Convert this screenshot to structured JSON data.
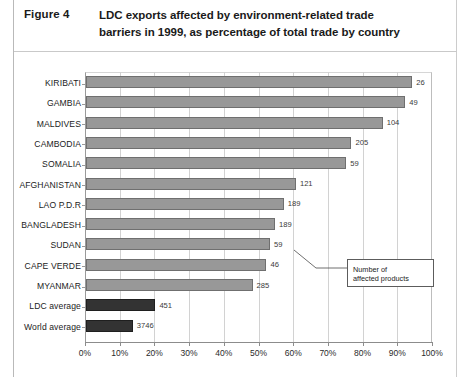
{
  "figure": {
    "label": "Figure 4",
    "title_line1": "LDC exports affected by environment-related trade",
    "title_line2": "barriers in 1999, as percentage of total trade by country"
  },
  "annotation": {
    "line1": "Number of",
    "line2": "affected products"
  },
  "footnote": "",
  "colors": {
    "bar_country": "#989898",
    "bar_average": "#333333",
    "bar_border": "#6e6e6e",
    "grid": "#d2d2d2",
    "axis": "#8c8c8c",
    "text": "#1c1c1c",
    "page_rule": "#b9b9b9"
  },
  "chart_data": {
    "type": "bar",
    "orientation": "horizontal",
    "title": "LDC exports affected by environment-related trade barriers in 1999, as percentage of total trade by country",
    "xlabel": "",
    "ylabel": "",
    "xlim": [
      0,
      100
    ],
    "xtick_labels": [
      "0%",
      "10%",
      "20%",
      "30%",
      "40%",
      "50%",
      "60%",
      "70%",
      "80%",
      "90%",
      "100%"
    ],
    "xtick_values": [
      0,
      10,
      20,
      30,
      40,
      50,
      60,
      70,
      80,
      90,
      100
    ],
    "grid": true,
    "legend": false,
    "value_label_name": "Number of affected products",
    "categories": [
      "KIRIBATI",
      "GAMBIA",
      "MALDIVES",
      "CAMBODIA",
      "SOMALIA",
      "AFGHANISTAN",
      "LAO P.D.R",
      "BANGLADESH",
      "SUDAN",
      "CAPE VERDE",
      "MYANMAR",
      "LDC average",
      "World average"
    ],
    "values": [
      94.0,
      92.0,
      85.5,
      76.5,
      75.0,
      60.5,
      57.0,
      54.5,
      53.0,
      52.0,
      48.0,
      20.0,
      13.5
    ],
    "point_labels": [
      "26",
      "49",
      "104",
      "205",
      "59",
      "121",
      "189",
      "189",
      "59",
      "46",
      "285",
      "451",
      "3746"
    ],
    "series_kind": [
      "country",
      "country",
      "country",
      "country",
      "country",
      "country",
      "country",
      "country",
      "country",
      "country",
      "country",
      "average",
      "average"
    ]
  }
}
